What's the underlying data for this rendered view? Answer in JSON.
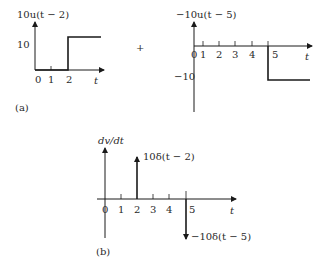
{
  "panel_a": {
    "caption": "(a)",
    "left_plot": {
      "ylabel": "10u(t − 2)",
      "y_tick": "10",
      "x_ticks": [
        "0",
        "1",
        "2"
      ],
      "xlabel": "t",
      "step_at": 2,
      "step_value": 10
    },
    "operator": "+",
    "right_plot": {
      "ylabel": "−10u(t − 5)",
      "y_tick": "−10",
      "x_ticks": [
        "0",
        "1",
        "2",
        "3",
        "4",
        "5"
      ],
      "xlabel": "t",
      "step_at": 5,
      "step_value": -10
    }
  },
  "panel_b": {
    "caption": "(b)",
    "ylabel": "dv/dt",
    "x_ticks": [
      "0",
      "1",
      "2",
      "3",
      "4",
      "5"
    ],
    "xlabel": "t",
    "impulse_up_label": "10δ(t − 2)",
    "impulse_down_label": "−10δ(t − 5)"
  },
  "colors": {
    "line": "#1a1a1a",
    "text": "#2a2a2a"
  }
}
